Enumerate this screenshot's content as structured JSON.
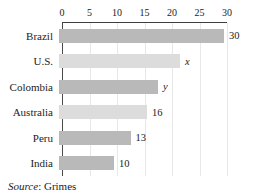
{
  "chart_data": {
    "type": "bar",
    "orientation": "horizontal",
    "title": "",
    "xlabel": "",
    "ylabel": "",
    "categories": [
      "Brazil",
      "U.S.",
      "Colombia",
      "Australia",
      "Peru",
      "India"
    ],
    "values": [
      30,
      22,
      18,
      16,
      13,
      10
    ],
    "data_labels": [
      "30",
      "x",
      "y",
      "16",
      "13",
      "10"
    ],
    "data_label_italic": [
      false,
      true,
      true,
      false,
      false,
      false
    ],
    "bar_colors": [
      "#b9b9b9",
      "#dcdcdc",
      "#b9b9b9",
      "#dcdcdc",
      "#b9b9b9",
      "#b9b9b9"
    ],
    "axis": {
      "position": "top",
      "min": 0,
      "max": 30,
      "ticks": [
        0,
        5,
        10,
        15,
        20,
        25,
        30
      ]
    },
    "grid": true,
    "legend": null,
    "source": {
      "italic_part": "Source",
      "rest_part": ": Grimes"
    }
  },
  "colors": {
    "bar_dark": "#b9b9b9",
    "bar_light": "#dcdcdc",
    "gridline": "#e7e7e7",
    "axis_line": "#3f3f3f",
    "text": "#1c1c1c",
    "background": "#ffffff"
  }
}
